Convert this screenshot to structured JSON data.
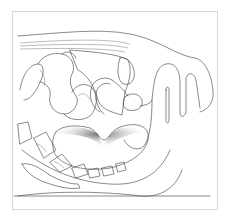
{
  "figure": {
    "kind": "anatomical line illustration",
    "view": "sagittal section",
    "colors": {
      "background": "#ffffff",
      "frame_border": "#d9d9d9",
      "line": "#3a3a3a"
    }
  }
}
